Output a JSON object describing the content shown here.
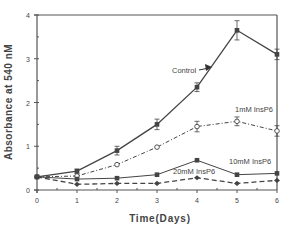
{
  "chart_data": {
    "type": "line",
    "title": "",
    "xlabel": "Time(Days)",
    "ylabel": "Absorbance at 540 nM",
    "xlim": [
      0,
      6
    ],
    "ylim": [
      0,
      4
    ],
    "x_ticks": [
      "0",
      "1",
      "2",
      "3",
      "4",
      "5",
      "6"
    ],
    "y_ticks": [
      "0",
      "1",
      "2",
      "3",
      "4"
    ],
    "grid": false,
    "x": [
      0,
      1,
      2,
      3,
      4,
      5,
      6
    ],
    "series": [
      {
        "name": "Control",
        "marker": "filled-square",
        "line": "solid",
        "values": [
          0.3,
          0.43,
          0.9,
          1.5,
          2.35,
          3.65,
          3.1
        ],
        "errors": [
          0.03,
          0.05,
          0.1,
          0.12,
          0.1,
          0.22,
          0.12
        ]
      },
      {
        "name": "1mM InsP6",
        "marker": "open-circle",
        "line": "dash-dot",
        "values": [
          0.3,
          0.32,
          0.58,
          0.98,
          1.45,
          1.57,
          1.35
        ],
        "errors": [
          0.02,
          0.03,
          0.03,
          0.03,
          0.12,
          0.1,
          0.12
        ]
      },
      {
        "name": "10mM InsP6",
        "marker": "filled-square",
        "line": "solid-thin",
        "values": [
          0.3,
          0.25,
          0.27,
          0.35,
          0.68,
          0.35,
          0.38
        ],
        "errors": [
          0.02,
          0.02,
          0.02,
          0.02,
          0.03,
          0.02,
          0.02
        ]
      },
      {
        "name": "20mM InsP6",
        "marker": "filled-diamond",
        "line": "dashed",
        "values": [
          0.3,
          0.13,
          0.15,
          0.15,
          0.28,
          0.15,
          0.22
        ],
        "errors": [
          0.02,
          0.02,
          0.02,
          0.02,
          0.02,
          0.02,
          0.02
        ]
      }
    ],
    "annotations": [
      {
        "text": "Control",
        "arrow_to_series": "Control"
      },
      {
        "text": "1mM InsP6"
      },
      {
        "text": "10mM InsP6"
      },
      {
        "text": "20mM InsP6"
      }
    ]
  },
  "labels": {
    "xlabel": "Time(Days)",
    "ylabel": "Absorbance at 540 nM",
    "control": "Control",
    "mm1": "1mM InsP6",
    "mm10": "10mM InsP6",
    "mm20": "20mM InsP6"
  }
}
